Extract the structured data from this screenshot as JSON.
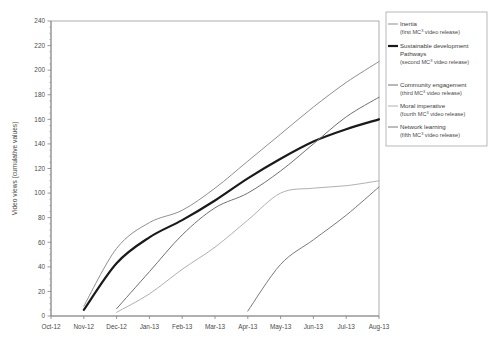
{
  "chart_data": {
    "type": "line",
    "title": "",
    "xlabel": "",
    "ylabel": "Video views (cumulative values)",
    "ylim": [
      0,
      240
    ],
    "ytick_step": 20,
    "yticks": [
      0,
      20,
      40,
      60,
      80,
      100,
      120,
      140,
      160,
      180,
      200,
      220,
      240
    ],
    "grid": false,
    "legend_position": "right-top",
    "categories": [
      "Oct-12",
      "Nov-12",
      "Dec-12",
      "Jan-13",
      "Feb-13",
      "Mar-13",
      "Apr-13",
      "May-13",
      "Jun-13",
      "Jul-13",
      "Aug-13"
    ],
    "x": [
      0,
      1,
      2,
      3,
      4,
      5,
      6,
      7,
      8,
      9,
      10
    ],
    "series": [
      {
        "name": "Inertia",
        "sub": "(first MC3 video release)",
        "color": "#8f8f8f",
        "width": 1.0,
        "values": [
          null,
          8,
          55,
          76,
          86,
          104,
          126,
          148,
          170,
          190,
          207
        ]
      },
      {
        "name": "Sustainable development Pathways",
        "sub": "(second MC3 video release)",
        "color": "#1a1a1a",
        "width": 2.2,
        "values": [
          null,
          5,
          43,
          64,
          78,
          94,
          112,
          128,
          142,
          152,
          160
        ]
      },
      {
        "name": "Community engagement",
        "sub": "(third MC3 video release)",
        "color": "#707070",
        "width": 1.0,
        "values": [
          null,
          null,
          6,
          36,
          66,
          88,
          100,
          118,
          140,
          162,
          178
        ]
      },
      {
        "name": "Moral imperative",
        "sub": "(fourth MC3 video release)",
        "color": "#b0b0b0",
        "width": 1.0,
        "values": [
          null,
          null,
          3,
          18,
          38,
          56,
          78,
          100,
          104,
          106,
          110
        ]
      },
      {
        "name": "Network learning",
        "sub": "(fifth MC3 video release)",
        "color": "#7a7a7a",
        "width": 1.0,
        "values": [
          null,
          null,
          null,
          null,
          null,
          null,
          4,
          42,
          62,
          82,
          105
        ]
      }
    ]
  },
  "legend": {
    "entries": [
      {
        "label": "Inertia",
        "sub_pre": "(first MC",
        "sub_sup": "3",
        "sub_post": " video release)"
      },
      {
        "label": "Sustainable development",
        "label2": "Pathways",
        "sub_pre": "(second MC",
        "sub_sup": "3",
        "sub_post": " video release)"
      },
      {
        "label": "Community engagement",
        "sub_pre": "(third MC",
        "sub_sup": "3",
        "sub_post": " video release)"
      },
      {
        "label": "Moral imperative",
        "sub_pre": "(fourth MC",
        "sub_sup": "3",
        "sub_post": " video release)"
      },
      {
        "label": "Network learning",
        "sub_pre": "(fifth MC",
        "sub_sup": "3",
        "sub_post": " video release)"
      }
    ]
  }
}
